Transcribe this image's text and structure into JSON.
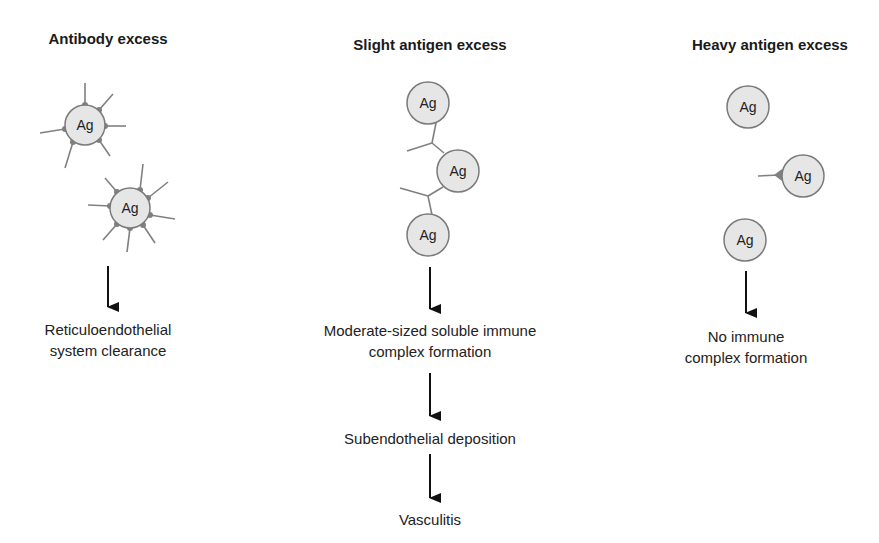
{
  "columns": [
    {
      "title": "Antibody excess",
      "antigen_label": "Ag",
      "antigen_count": 2,
      "steps": [
        "Reticuloendothelial system clearance"
      ],
      "step_lines": [
        [
          "Reticuloendothelial",
          "system clearance"
        ]
      ]
    },
    {
      "title": "Slight antigen excess",
      "antigen_label": "Ag",
      "antigen_count": 3,
      "steps": [
        "Moderate-sized soluble immune complex formation",
        "Subendothelial deposition",
        "Vasculitis"
      ],
      "step_lines": [
        [
          "Moderate-sized soluble immune",
          "complex formation"
        ],
        [
          "Subendothelial deposition"
        ],
        [
          "Vasculitis"
        ]
      ]
    },
    {
      "title": "Heavy antigen excess",
      "antigen_label": "Ag",
      "antigen_count": 3,
      "steps": [
        "No immune complex formation"
      ],
      "step_lines": [
        [
          "No immune",
          "complex formation"
        ]
      ]
    }
  ],
  "colors": {
    "antigen_fill": "#e6e6e6",
    "antigen_stroke": "#7a7a7a",
    "antibody": "#808080",
    "arrow": "#111111",
    "text": "#1a1a1a"
  }
}
